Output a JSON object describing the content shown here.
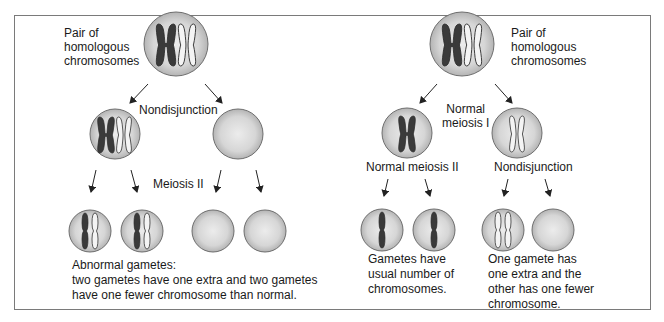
{
  "colors": {
    "cell_fill_outer": "#bdbdbd",
    "cell_fill_inner": "#e4e4e4",
    "cell_stroke": "#6e6e6e",
    "chromosome_dark": "#3a3a3a",
    "chromosome_light": "#f2f2f2",
    "chromosome_stroke": "#333333",
    "frame_border": "#7a7a7a"
  },
  "left_panel": {
    "title_label": [
      "Pair of",
      "homologous",
      "chromosomes"
    ],
    "step1_label": "Nondisjunction",
    "step2_label": "Meiosis II",
    "result_label": [
      "Abnormal gametes:",
      "two gametes have one extra and two gametes",
      "have one fewer chromosome than normal."
    ]
  },
  "right_panel": {
    "title_label": [
      "Pair of",
      "homologous",
      "chromosomes"
    ],
    "step1_label": [
      "Normal",
      "meiosis I"
    ],
    "step2_left_label": "Normal meiosis II",
    "step2_right_label": "Nondisjunction",
    "result_left_label": [
      "Gametes have",
      "usual number of",
      "chromosomes."
    ],
    "result_right_label": [
      "One gamete has",
      "one extra and the",
      "other has one fewer",
      "chromosome."
    ]
  }
}
